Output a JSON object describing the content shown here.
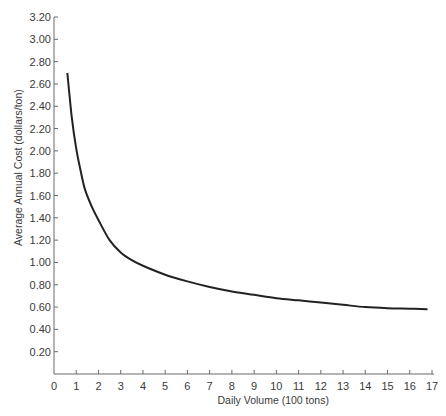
{
  "chart_data": {
    "type": "line",
    "title": "",
    "xlabel": "Daily Volume (100 tons)",
    "ylabel": "Average Annual Cost (dollars/ton)",
    "xlim": [
      0,
      17
    ],
    "ylim": [
      0,
      3.2
    ],
    "grid": false,
    "legend": null,
    "x_ticks": [
      "0",
      "1",
      "2",
      "3",
      "4",
      "5",
      "6",
      "7",
      "8",
      "9",
      "10",
      "11",
      "12",
      "13",
      "14",
      "15",
      "16",
      "17"
    ],
    "y_ticks": [
      "0.20",
      "0.40",
      "0.60",
      "0.80",
      "1.00",
      "1.20",
      "1.40",
      "1.60",
      "1.80",
      "2.00",
      "2.20",
      "2.40",
      "2.60",
      "2.80",
      "3.00",
      "3.20"
    ],
    "series": [
      {
        "name": "Average annual cost",
        "color": "#222222",
        "x": [
          0.6,
          0.8,
          1.0,
          1.2,
          1.4,
          1.7,
          2.0,
          2.5,
          3.0,
          3.5,
          4.0,
          5.0,
          6.0,
          7.0,
          8.0,
          9.0,
          10.0,
          11.0,
          12.0,
          13.0,
          14.0,
          15.0,
          16.0,
          16.8
        ],
        "y": [
          2.7,
          2.3,
          2.02,
          1.82,
          1.65,
          1.5,
          1.38,
          1.2,
          1.09,
          1.02,
          0.97,
          0.89,
          0.83,
          0.78,
          0.74,
          0.71,
          0.68,
          0.66,
          0.64,
          0.62,
          0.6,
          0.59,
          0.585,
          0.58
        ]
      }
    ]
  }
}
